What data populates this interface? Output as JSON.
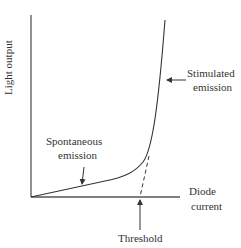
{
  "diagram": {
    "title": "",
    "axes": {
      "y_label": "Light output",
      "x_label_line1": "Diode",
      "x_label_line2": "current"
    },
    "annotations": {
      "stimulated_line1": "Stimulated",
      "stimulated_line2": "emission",
      "spontaneous_line1": "Spontaneous",
      "spontaneous_line2": "emission",
      "threshold": "Threshold"
    },
    "colors": {
      "line": "#333333",
      "axis": "#555555",
      "background": "#ffffff"
    }
  }
}
